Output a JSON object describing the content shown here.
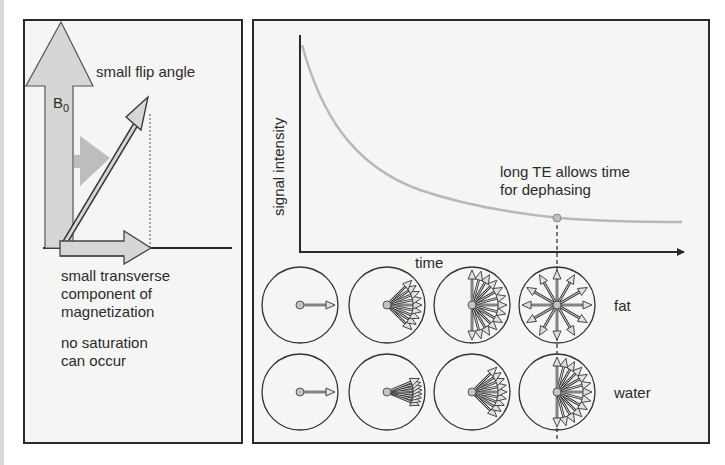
{
  "left_panel": {
    "field_label_main": "B",
    "field_label_sub": "0",
    "flip_angle_label": "small flip angle",
    "transverse_label_lines": [
      "small transverse",
      "component of",
      "magnetization"
    ],
    "saturation_label_lines": [
      "no saturation",
      "can occur"
    ]
  },
  "right_panel": {
    "y_axis_label": "signal intensity",
    "x_axis_label": "time",
    "annotation_lines": [
      "long TE allows time",
      "for dephasing"
    ],
    "row_labels": [
      "fat",
      "water"
    ]
  },
  "colors": {
    "border": "#2a2a2a",
    "panel_bg": "#f5f5f4",
    "arrow_fill": "#d6d6d4",
    "arrow_fill_dark": "#bdbdbb",
    "curve": "#b8b8b6",
    "text": "#2b2b2b"
  },
  "chart_data": {
    "type": "line",
    "title": "",
    "xlabel": "time",
    "ylabel": "signal intensity",
    "series": [
      {
        "name": "signal decay (T2*)",
        "x": [
          0,
          0.1,
          0.2,
          0.3,
          0.4,
          0.5,
          0.6,
          0.7,
          0.8,
          0.9,
          1.0
        ],
        "values": [
          1.0,
          0.68,
          0.49,
          0.37,
          0.29,
          0.24,
          0.2,
          0.17,
          0.15,
          0.14,
          0.13
        ]
      }
    ],
    "annotations": [
      {
        "text": "long TE allows time for dephasing",
        "x": 0.67,
        "y": 0.17,
        "marker": "dot with dashed vertical line"
      }
    ],
    "grid": false,
    "spin_diagrams": {
      "rows": [
        "fat",
        "water"
      ],
      "columns": 4,
      "description": "phase dispersion of spins increasing with time; fat dephases fully (360°) by the TE marker, water fans to ~180°",
      "fat_spread_degrees": [
        0,
        90,
        180,
        360
      ],
      "water_spread_degrees": [
        0,
        45,
        90,
        180
      ]
    }
  }
}
